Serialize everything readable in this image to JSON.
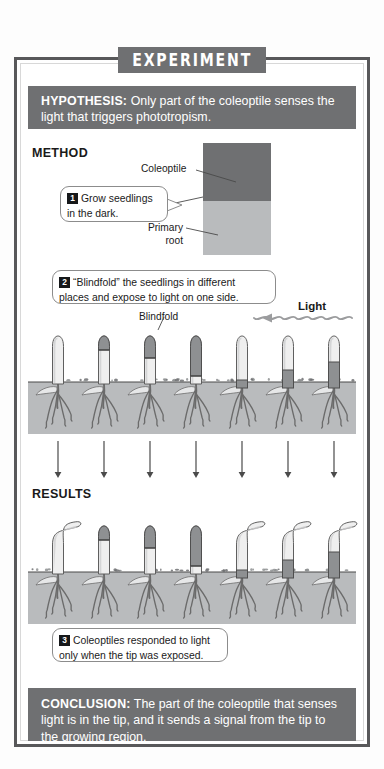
{
  "figure": {
    "header": "EXPERIMENT",
    "hypothesis_label": "HYPOTHESIS:",
    "hypothesis_text": " Only part of the coleoptile senses the light that triggers phototropism.",
    "conclusion_label": "CONCLUSION:",
    "conclusion_text": " The part of the coleoptile that senses light is in the tip, and it sends a signal from the tip to the growing region."
  },
  "sections": {
    "method_label": "METHOD",
    "results_label": "RESULTS"
  },
  "steps": [
    {
      "number": "1",
      "text": "Grow seedlings in the dark."
    },
    {
      "number": "2",
      "text": "“Blindfold” the seedlings in different places and expose to light on one side."
    },
    {
      "number": "3",
      "text": "Coleoptiles responded to light only when the tip was exposed."
    }
  ],
  "labels": {
    "coleoptile": "Coleoptile",
    "primary_root": "Primary\nroot",
    "primary_root_line1": "Primary",
    "primary_root_line2": "root",
    "blindfold": "Blindfold",
    "light": "Light"
  },
  "colors": {
    "banner_gray": "#6f7072",
    "frame_gray": "#58585a",
    "soil_gray": "#b9bbbd",
    "blindfold_gray": "#8e9092",
    "coleoptile_pale": "#efefef",
    "text_dark": "#1a1a1a",
    "white": "#ffffff"
  },
  "method_seedlings": [
    {
      "id": 1,
      "blindfold": "none",
      "cover_top": 0,
      "cover_bottom": 0,
      "description": "control, no blindfold"
    },
    {
      "id": 2,
      "blindfold": "tip-cap",
      "cover_top": 0,
      "cover_bottom": 14,
      "description": "small opaque cap over tip"
    },
    {
      "id": 3,
      "blindfold": "tip-cap",
      "cover_top": 0,
      "cover_bottom": 22,
      "description": "larger opaque cap over tip"
    },
    {
      "id": 4,
      "blindfold": "tip-cap",
      "cover_top": 0,
      "cover_bottom": 40,
      "description": "long opaque cap over upper half"
    },
    {
      "id": 5,
      "blindfold": "lower-band",
      "cover_top": 44,
      "cover_bottom": 52,
      "description": "narrow band low on shoot, tip exposed"
    },
    {
      "id": 6,
      "blindfold": "lower-band",
      "cover_top": 34,
      "cover_bottom": 52,
      "description": "band low on shoot, tip exposed"
    },
    {
      "id": 7,
      "blindfold": "lower-band",
      "cover_top": 26,
      "cover_bottom": 52,
      "description": "taller band on shoot, tip exposed"
    }
  ],
  "results_seedlings": [
    {
      "id": 1,
      "bent": true,
      "description": "bends toward light (tip exposed)"
    },
    {
      "id": 2,
      "bent": false,
      "description": "grows straight (tip covered)"
    },
    {
      "id": 3,
      "bent": false,
      "description": "grows straight (tip covered)"
    },
    {
      "id": 4,
      "bent": false,
      "description": "grows straight (tip covered)"
    },
    {
      "id": 5,
      "bent": true,
      "description": "bends toward light (tip exposed)"
    },
    {
      "id": 6,
      "bent": true,
      "description": "bends toward light (tip exposed)"
    },
    {
      "id": 7,
      "bent": true,
      "description": "bends toward light (tip exposed)"
    }
  ],
  "arrows": {
    "count": 7,
    "direction": "down"
  }
}
